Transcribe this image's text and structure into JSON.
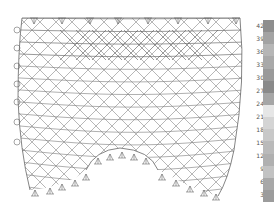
{
  "diagram": {
    "type": "single-layer lattice shell structure (grid contour plot)",
    "line_color": "#7a7a7a",
    "dark_line_color": "#555555",
    "support_color": "#6a6a6a",
    "supports": {
      "top_edge_count": 8,
      "left_edge_count": 7,
      "bottom_left_count": 5,
      "bottom_arch_count": 5,
      "bottom_right_count": 5
    }
  },
  "legend": {
    "labels": [
      "42",
      "39",
      "36",
      "33",
      "30",
      "27",
      "24",
      "21",
      "18",
      "15",
      "12",
      "9",
      "6",
      "3"
    ],
    "bands": [
      "#8e8e8e",
      "#a3a3a3",
      "#b6b6b6",
      "#a9a9a9",
      "#9a9a9a",
      "#8a8a8a",
      "#a6a6a6",
      "#e6e6e6",
      "#d4d4d4",
      "#c8c8c8",
      "#bababa",
      "#b0b0b0",
      "#c2c2c2",
      "#a8a8a8",
      "#9c9c9c"
    ]
  }
}
